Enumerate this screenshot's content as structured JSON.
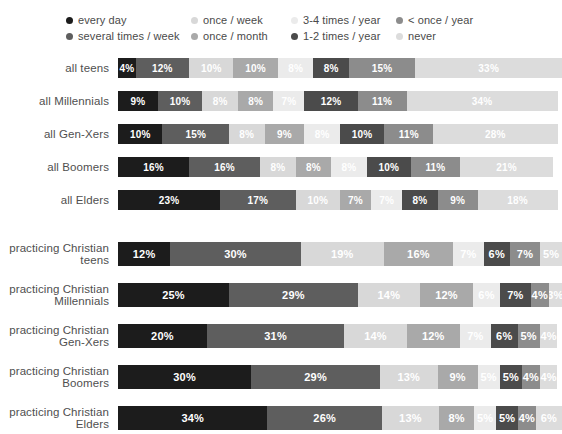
{
  "legend": {
    "rows": [
      [
        {
          "label": "every day",
          "color": "#1c1c1c",
          "col": "lg-c0"
        },
        {
          "label": "once / week",
          "color": "#d8d8d8",
          "col": "lg-c1"
        },
        {
          "label": "3-4 times / year",
          "color": "#ebebeb",
          "col": "lg-c2"
        },
        {
          "label": "< once / year",
          "color": "#8c8c8c",
          "col": "lg-c3"
        }
      ],
      [
        {
          "label": "several times / week",
          "color": "#5e5e5e",
          "col": "lg-c0"
        },
        {
          "label": "once / month",
          "color": "#a9a9a9",
          "col": "lg-c1"
        },
        {
          "label": "1-2 times / year",
          "color": "#4b4b4b",
          "col": "lg-c2"
        },
        {
          "label": "never",
          "color": "#dcdcdc",
          "col": "lg-c3"
        }
      ]
    ]
  },
  "chart_data": {
    "type": "bar",
    "title": "",
    "xlabel": "",
    "ylabel": "",
    "orientation": "horizontal",
    "stacked": true,
    "stack_total": 100,
    "units": "%",
    "grid": false,
    "legend_position": "top",
    "categories": [
      "all teens",
      "all Millennials",
      "all Gen-Xers",
      "all Boomers",
      "all Elders",
      "practicing Christian teens",
      "practicing Christian Millennials",
      "practicing Christian Gen-Xers",
      "practicing Christian Boomers",
      "practicing Christian Elders"
    ],
    "series": [
      {
        "name": "every day",
        "color": "#1c1c1c",
        "text": "#ffffff",
        "values": [
          4,
          9,
          10,
          16,
          23,
          12,
          25,
          20,
          30,
          34
        ]
      },
      {
        "name": "several times / week",
        "color": "#5e5e5e",
        "text": "#ffffff",
        "values": [
          12,
          10,
          15,
          16,
          17,
          30,
          29,
          31,
          29,
          26
        ]
      },
      {
        "name": "once / week",
        "color": "#d8d8d8",
        "text": "#ffffff",
        "values": [
          10,
          8,
          8,
          8,
          10,
          19,
          14,
          14,
          13,
          13
        ]
      },
      {
        "name": "once / month",
        "color": "#a9a9a9",
        "text": "#ffffff",
        "values": [
          10,
          8,
          9,
          8,
          7,
          16,
          12,
          12,
          9,
          8
        ]
      },
      {
        "name": "3-4 times / year",
        "color": "#ebebeb",
        "text": "#ffffff",
        "values": [
          8,
          7,
          8,
          8,
          7,
          7,
          6,
          7,
          5,
          5
        ]
      },
      {
        "name": "1-2 times / year",
        "color": "#4b4b4b",
        "text": "#ffffff",
        "values": [
          8,
          12,
          10,
          10,
          8,
          6,
          7,
          6,
          5,
          5
        ]
      },
      {
        "name": "< once / year",
        "color": "#8c8c8c",
        "text": "#ffffff",
        "values": [
          15,
          11,
          11,
          11,
          9,
          7,
          4,
          5,
          4,
          4
        ]
      },
      {
        "name": "never",
        "color": "#dcdcdc",
        "text": "#ffffff",
        "values": [
          33,
          34,
          28,
          21,
          18,
          5,
          3,
          4,
          4,
          6
        ]
      }
    ],
    "groups": [
      {
        "name": "general population",
        "rows": [
          0,
          1,
          2,
          3,
          4
        ]
      },
      {
        "name": "practicing Christians",
        "rows": [
          5,
          6,
          7,
          8,
          9
        ]
      }
    ]
  },
  "rows_display": [
    {
      "label_lines": [
        "all teens"
      ],
      "tall": false,
      "segments": [
        {
          "v": "4%",
          "w": 4,
          "color": "#1c1c1c",
          "text": "#ffffff"
        },
        {
          "v": "12%",
          "w": 12,
          "color": "#5e5e5e",
          "text": "#ffffff"
        },
        {
          "v": "10%",
          "w": 10,
          "color": "#d8d8d8",
          "text": "#ffffff"
        },
        {
          "v": "10%",
          "w": 10,
          "color": "#a9a9a9",
          "text": "#ffffff"
        },
        {
          "v": "8%",
          "w": 8,
          "color": "#ebebeb",
          "text": "#ffffff"
        },
        {
          "v": "8%",
          "w": 8,
          "color": "#4b4b4b",
          "text": "#ffffff"
        },
        {
          "v": "15%",
          "w": 15,
          "color": "#8c8c8c",
          "text": "#ffffff"
        },
        {
          "v": "33%",
          "w": 33,
          "color": "#dcdcdc",
          "text": "#ffffff"
        }
      ]
    },
    {
      "label_lines": [
        "all Millennials"
      ],
      "tall": false,
      "segments": [
        {
          "v": "9%",
          "w": 9,
          "color": "#1c1c1c",
          "text": "#ffffff"
        },
        {
          "v": "10%",
          "w": 10,
          "color": "#5e5e5e",
          "text": "#ffffff"
        },
        {
          "v": "8%",
          "w": 8,
          "color": "#d8d8d8",
          "text": "#ffffff"
        },
        {
          "v": "8%",
          "w": 8,
          "color": "#a9a9a9",
          "text": "#ffffff"
        },
        {
          "v": "7%",
          "w": 7,
          "color": "#ebebeb",
          "text": "#ffffff"
        },
        {
          "v": "12%",
          "w": 12,
          "color": "#4b4b4b",
          "text": "#ffffff"
        },
        {
          "v": "11%",
          "w": 11,
          "color": "#8c8c8c",
          "text": "#ffffff"
        },
        {
          "v": "34%",
          "w": 34,
          "color": "#dcdcdc",
          "text": "#ffffff"
        }
      ]
    },
    {
      "label_lines": [
        "all Gen-Xers"
      ],
      "tall": false,
      "segments": [
        {
          "v": "10%",
          "w": 10,
          "color": "#1c1c1c",
          "text": "#ffffff"
        },
        {
          "v": "15%",
          "w": 15,
          "color": "#5e5e5e",
          "text": "#ffffff"
        },
        {
          "v": "8%",
          "w": 8,
          "color": "#d8d8d8",
          "text": "#ffffff"
        },
        {
          "v": "9%",
          "w": 9,
          "color": "#a9a9a9",
          "text": "#ffffff"
        },
        {
          "v": "8%",
          "w": 8,
          "color": "#ebebeb",
          "text": "#ffffff"
        },
        {
          "v": "10%",
          "w": 10,
          "color": "#4b4b4b",
          "text": "#ffffff"
        },
        {
          "v": "11%",
          "w": 11,
          "color": "#8c8c8c",
          "text": "#ffffff"
        },
        {
          "v": "28%",
          "w": 28,
          "color": "#dcdcdc",
          "text": "#ffffff"
        }
      ]
    },
    {
      "label_lines": [
        "all Boomers"
      ],
      "tall": false,
      "segments": [
        {
          "v": "16%",
          "w": 16,
          "color": "#1c1c1c",
          "text": "#ffffff"
        },
        {
          "v": "16%",
          "w": 16,
          "color": "#5e5e5e",
          "text": "#ffffff"
        },
        {
          "v": "8%",
          "w": 8,
          "color": "#d8d8d8",
          "text": "#ffffff"
        },
        {
          "v": "8%",
          "w": 8,
          "color": "#a9a9a9",
          "text": "#ffffff"
        },
        {
          "v": "8%",
          "w": 8,
          "color": "#ebebeb",
          "text": "#ffffff"
        },
        {
          "v": "10%",
          "w": 10,
          "color": "#4b4b4b",
          "text": "#ffffff"
        },
        {
          "v": "11%",
          "w": 11,
          "color": "#8c8c8c",
          "text": "#ffffff"
        },
        {
          "v": "21%",
          "w": 21,
          "color": "#dcdcdc",
          "text": "#ffffff"
        }
      ]
    },
    {
      "label_lines": [
        "all Elders"
      ],
      "tall": false,
      "segments": [
        {
          "v": "23%",
          "w": 23,
          "color": "#1c1c1c",
          "text": "#ffffff"
        },
        {
          "v": "17%",
          "w": 17,
          "color": "#5e5e5e",
          "text": "#ffffff"
        },
        {
          "v": "10%",
          "w": 10,
          "color": "#d8d8d8",
          "text": "#ffffff"
        },
        {
          "v": "7%",
          "w": 7,
          "color": "#a9a9a9",
          "text": "#ffffff"
        },
        {
          "v": "7%",
          "w": 7,
          "color": "#ebebeb",
          "text": "#ffffff"
        },
        {
          "v": "8%",
          "w": 8,
          "color": "#4b4b4b",
          "text": "#ffffff"
        },
        {
          "v": "9%",
          "w": 9,
          "color": "#8c8c8c",
          "text": "#ffffff"
        },
        {
          "v": "18%",
          "w": 18,
          "color": "#dcdcdc",
          "text": "#ffffff"
        }
      ]
    },
    {
      "label_lines": [
        "practicing Christian",
        "teens"
      ],
      "tall": true,
      "segments": [
        {
          "v": "12%",
          "w": 12,
          "color": "#1c1c1c",
          "text": "#ffffff"
        },
        {
          "v": "30%",
          "w": 30,
          "color": "#5e5e5e",
          "text": "#ffffff"
        },
        {
          "v": "19%",
          "w": 19,
          "color": "#d8d8d8",
          "text": "#ffffff"
        },
        {
          "v": "16%",
          "w": 16,
          "color": "#a9a9a9",
          "text": "#ffffff"
        },
        {
          "v": "7%",
          "w": 7,
          "color": "#ebebeb",
          "text": "#ffffff"
        },
        {
          "v": "6%",
          "w": 6,
          "color": "#4b4b4b",
          "text": "#ffffff"
        },
        {
          "v": "7%",
          "w": 7,
          "color": "#8c8c8c",
          "text": "#ffffff"
        },
        {
          "v": "5%",
          "w": 5,
          "color": "#dcdcdc",
          "text": "#ffffff"
        }
      ]
    },
    {
      "label_lines": [
        "practicing Christian",
        "Millennials"
      ],
      "tall": true,
      "segments": [
        {
          "v": "25%",
          "w": 25,
          "color": "#1c1c1c",
          "text": "#ffffff"
        },
        {
          "v": "29%",
          "w": 29,
          "color": "#5e5e5e",
          "text": "#ffffff"
        },
        {
          "v": "14%",
          "w": 14,
          "color": "#d8d8d8",
          "text": "#ffffff"
        },
        {
          "v": "12%",
          "w": 12,
          "color": "#a9a9a9",
          "text": "#ffffff"
        },
        {
          "v": "6%",
          "w": 6,
          "color": "#ebebeb",
          "text": "#ffffff"
        },
        {
          "v": "7%",
          "w": 7,
          "color": "#4b4b4b",
          "text": "#ffffff"
        },
        {
          "v": "4%",
          "w": 4,
          "color": "#8c8c8c",
          "text": "#ffffff"
        },
        {
          "v": "3%",
          "w": 3,
          "color": "#dcdcdc",
          "text": "#ffffff"
        }
      ]
    },
    {
      "label_lines": [
        "practicing Christian",
        "Gen-Xers"
      ],
      "tall": true,
      "segments": [
        {
          "v": "20%",
          "w": 20,
          "color": "#1c1c1c",
          "text": "#ffffff"
        },
        {
          "v": "31%",
          "w": 31,
          "color": "#5e5e5e",
          "text": "#ffffff"
        },
        {
          "v": "14%",
          "w": 14,
          "color": "#d8d8d8",
          "text": "#ffffff"
        },
        {
          "v": "12%",
          "w": 12,
          "color": "#a9a9a9",
          "text": "#ffffff"
        },
        {
          "v": "7%",
          "w": 7,
          "color": "#ebebeb",
          "text": "#ffffff"
        },
        {
          "v": "6%",
          "w": 6,
          "color": "#4b4b4b",
          "text": "#ffffff"
        },
        {
          "v": "5%",
          "w": 5,
          "color": "#8c8c8c",
          "text": "#ffffff"
        },
        {
          "v": "4%",
          "w": 4,
          "color": "#dcdcdc",
          "text": "#ffffff"
        }
      ]
    },
    {
      "label_lines": [
        "practicing Christian",
        "Boomers"
      ],
      "tall": true,
      "segments": [
        {
          "v": "30%",
          "w": 30,
          "color": "#1c1c1c",
          "text": "#ffffff"
        },
        {
          "v": "29%",
          "w": 29,
          "color": "#5e5e5e",
          "text": "#ffffff"
        },
        {
          "v": "13%",
          "w": 13,
          "color": "#d8d8d8",
          "text": "#ffffff"
        },
        {
          "v": "9%",
          "w": 9,
          "color": "#a9a9a9",
          "text": "#ffffff"
        },
        {
          "v": "5%",
          "w": 5,
          "color": "#ebebeb",
          "text": "#ffffff"
        },
        {
          "v": "5%",
          "w": 5,
          "color": "#4b4b4b",
          "text": "#ffffff"
        },
        {
          "v": "4%",
          "w": 4,
          "color": "#8c8c8c",
          "text": "#ffffff"
        },
        {
          "v": "4%",
          "w": 4,
          "color": "#dcdcdc",
          "text": "#ffffff"
        }
      ]
    },
    {
      "label_lines": [
        "practicing Christian",
        "Elders"
      ],
      "tall": true,
      "segments": [
        {
          "v": "34%",
          "w": 34,
          "color": "#1c1c1c",
          "text": "#ffffff"
        },
        {
          "v": "26%",
          "w": 26,
          "color": "#5e5e5e",
          "text": "#ffffff"
        },
        {
          "v": "13%",
          "w": 13,
          "color": "#d8d8d8",
          "text": "#ffffff"
        },
        {
          "v": "8%",
          "w": 8,
          "color": "#a9a9a9",
          "text": "#ffffff"
        },
        {
          "v": "5%",
          "w": 5,
          "color": "#ebebeb",
          "text": "#ffffff"
        },
        {
          "v": "5%",
          "w": 5,
          "color": "#4b4b4b",
          "text": "#ffffff"
        },
        {
          "v": "4%",
          "w": 4,
          "color": "#8c8c8c",
          "text": "#ffffff"
        },
        {
          "v": "6%",
          "w": 6,
          "color": "#dcdcdc",
          "text": "#ffffff"
        }
      ]
    }
  ]
}
